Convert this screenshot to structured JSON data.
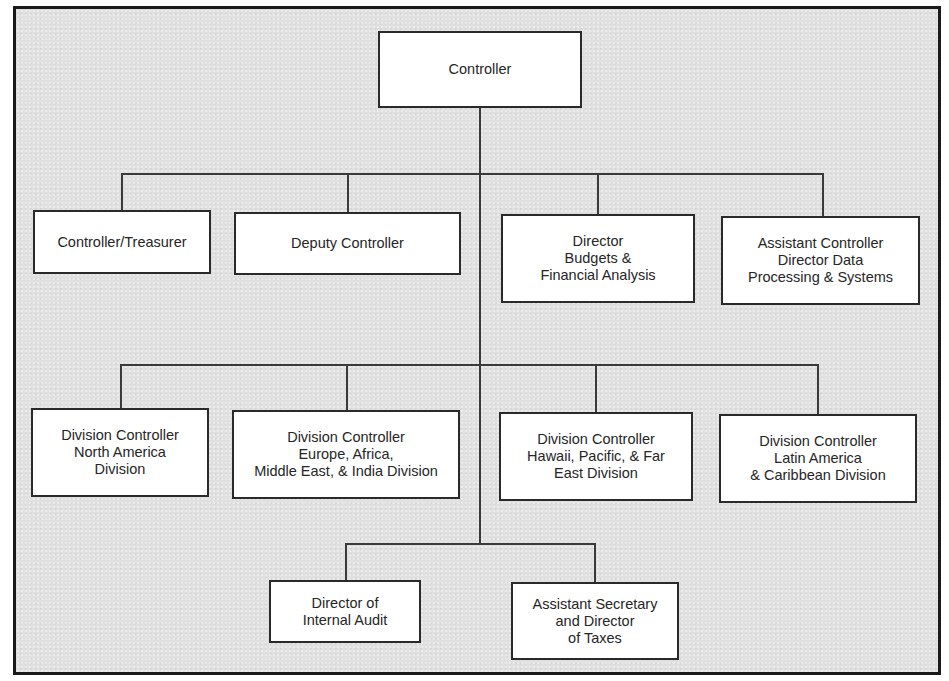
{
  "chart": {
    "type": "org-chart",
    "root": {
      "id": "controller",
      "label": "Controller"
    },
    "levels": [
      {
        "name": "staff-row",
        "nodes": [
          {
            "id": "controller-treasurer",
            "label": "Controller/Treasurer"
          },
          {
            "id": "deputy-controller",
            "label": "Deputy Controller"
          },
          {
            "id": "director-budgets",
            "label": "Director\nBudgets &\nFinancial Analysis"
          },
          {
            "id": "assistant-controller",
            "label": "Assistant Controller\nDirector Data\nProcessing & Systems"
          }
        ]
      },
      {
        "name": "division-row",
        "nodes": [
          {
            "id": "div-north-america",
            "label": "Division Controller\nNorth America\nDivision"
          },
          {
            "id": "div-europe",
            "label": "Division Controller\nEurope, Africa,\nMiddle East, & India Division"
          },
          {
            "id": "div-hawaii",
            "label": "Division Controller\nHawaii, Pacific, & Far\nEast Division"
          },
          {
            "id": "div-latin-america",
            "label": "Division Controller\nLatin America\n& Caribbean Division"
          }
        ]
      },
      {
        "name": "bottom-row",
        "nodes": [
          {
            "id": "internal-audit",
            "label": "Director of\nInternal Audit"
          },
          {
            "id": "taxes",
            "label": "Assistant Secretary\nand Director\nof Taxes"
          }
        ]
      }
    ]
  },
  "colors": {
    "background": "#e0e0e0",
    "box_fill": "#ffffff",
    "line": "#3a3a3a",
    "frame": "#1a1a1a",
    "text": "#262626"
  }
}
